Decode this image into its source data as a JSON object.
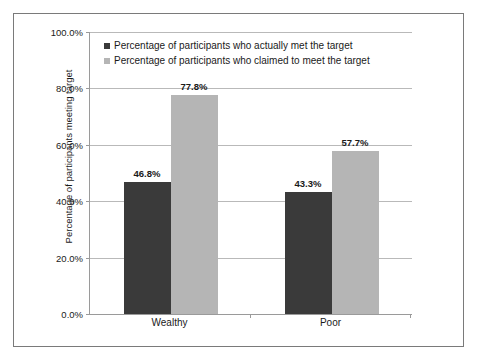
{
  "chart_data": {
    "type": "bar",
    "title": "",
    "xlabel": "",
    "ylabel": "Percentage of participants meeting target",
    "categories": [
      "Wealthy",
      "Poor"
    ],
    "series": [
      {
        "name": "Percentage of participants who actually met the target",
        "color": "#3a3a3a",
        "values": [
          46.8,
          43.3
        ],
        "labels": [
          "46.8%",
          "43.3%"
        ]
      },
      {
        "name": "Percentage of participants who claimed to meet the target",
        "color": "#b5b5b5",
        "values": [
          77.8,
          57.7
        ],
        "labels": [
          "77.8%",
          "57.7%"
        ]
      }
    ],
    "ylim": [
      0,
      100
    ],
    "yticks": [
      0,
      20,
      40,
      60,
      80,
      100
    ],
    "ytick_labels": [
      "0.0%",
      "20.0%",
      "40.0%",
      "60.0%",
      "80.0%",
      "100.0%"
    ],
    "grid": true,
    "legend_position": "top-left-inside"
  },
  "colors": {
    "frame_border": "#7a7a7a",
    "gridline": "#b9b9b9",
    "axis": "#9a9a9a",
    "text": "#1a1a1a",
    "background": "#ffffff"
  }
}
